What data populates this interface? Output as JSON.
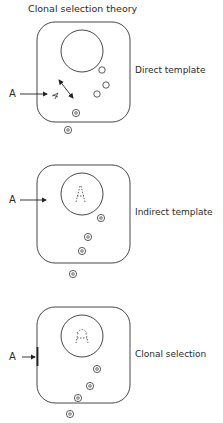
{
  "title": "Clonal selection theory",
  "panels": [
    {
      "label": "Direct template",
      "antigen_label": "A"
    },
    {
      "label": "Indirect template",
      "antigen_label": "A"
    },
    {
      "label": "Clonal selection",
      "antigen_label": "A"
    }
  ],
  "colors": {
    "stroke": "#333333",
    "background": "#ffffff",
    "text": "#2a2a2a"
  }
}
